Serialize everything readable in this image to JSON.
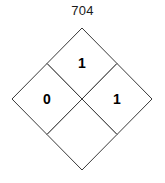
{
  "figure": {
    "title": "704",
    "type": "subdivided-diamond",
    "background_color": "#ffffff",
    "stroke_color": "#3a3a3a",
    "label_color": "#000000"
  },
  "diamond": {
    "outer_vertices": {
      "top": {
        "x": 82,
        "y": 28
      },
      "right": {
        "x": 152,
        "y": 99
      },
      "bottom": {
        "x": 82,
        "y": 170
      },
      "left": {
        "x": 12,
        "y": 99
      }
    },
    "center": {
      "x": 82,
      "y": 99
    },
    "cells": [
      {
        "position": "top",
        "label": "1",
        "cx": 82,
        "cy": 63
      },
      {
        "position": "left",
        "label": "0",
        "cx": 47,
        "cy": 99
      },
      {
        "position": "right",
        "label": "1",
        "cx": 117,
        "cy": 99
      },
      {
        "position": "bottom",
        "label": "",
        "cx": 82,
        "cy": 135
      }
    ]
  }
}
